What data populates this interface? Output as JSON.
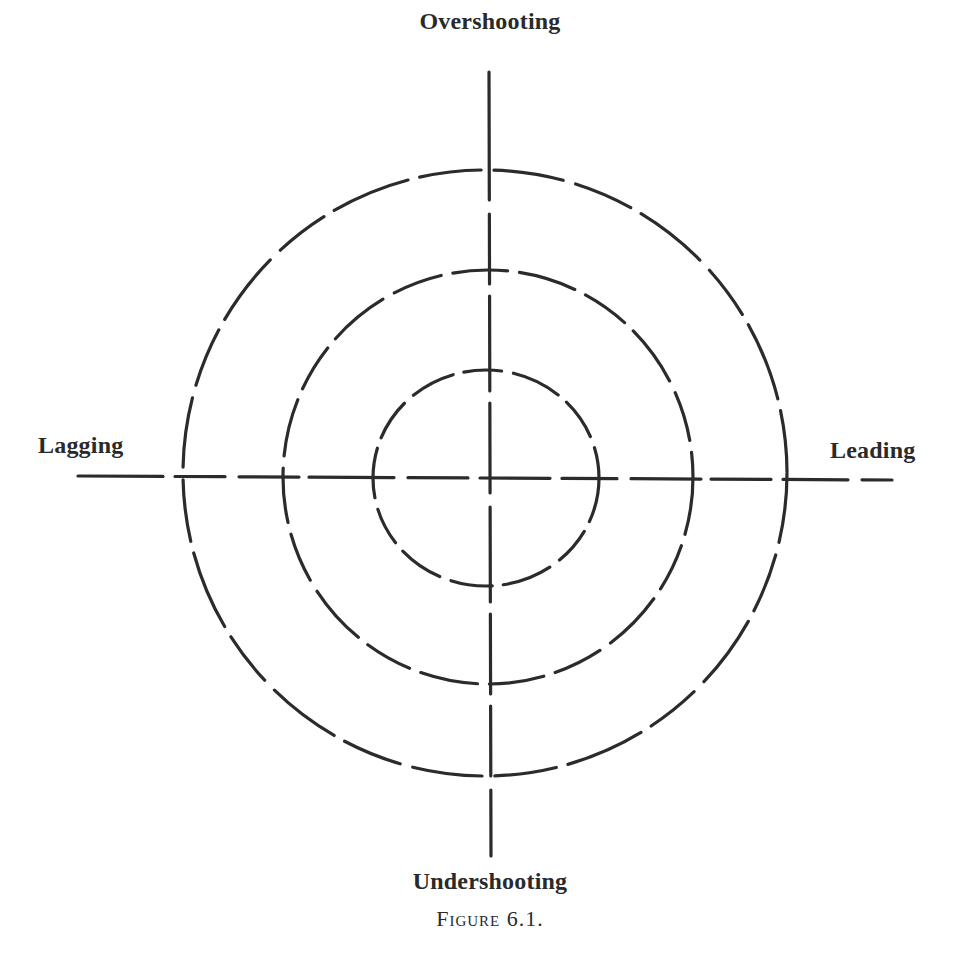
{
  "figure": {
    "caption": "Figure 6.1.",
    "axes": {
      "top": "Overshooting",
      "bottom": "Undershooting",
      "left": "Lagging",
      "right": "Leading"
    },
    "rings": [
      {
        "name": "inner",
        "rx": 113,
        "ry": 108
      },
      {
        "name": "middle",
        "rx": 205,
        "ry": 207
      },
      {
        "name": "outer",
        "rx": 302,
        "ry": 303
      }
    ],
    "stroke_color": "#2b2b2b"
  }
}
